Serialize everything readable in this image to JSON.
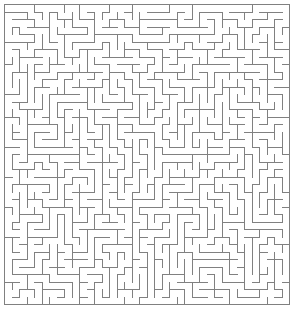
{
  "figure": {
    "kind": "maze-puzzle",
    "background_color": "#ffffff"
  },
  "maze": {
    "columns": 38,
    "rows": 40,
    "cell_size_px": 7.5,
    "origin_x_px": 4,
    "origin_y_px": 4,
    "wall_color": "#808080",
    "wall_thickness_px": 1,
    "passage_color": "#ffffff",
    "border": "solid-closed",
    "has_entrance": false,
    "has_exit": false,
    "generation_seed": 20240517,
    "algorithm": "recursive-backtracker"
  },
  "canvas": {
    "width_px": 297,
    "height_px": 315
  }
}
